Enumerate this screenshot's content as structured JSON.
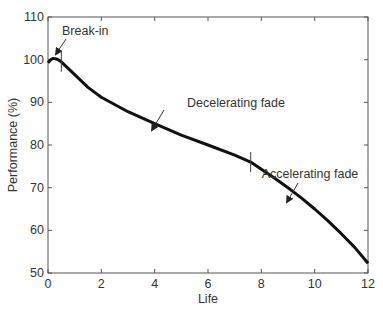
{
  "chart_data": {
    "type": "line",
    "title": "",
    "xlabel": "Life",
    "ylabel": "Performance (%)",
    "xlim": [
      0,
      12
    ],
    "ylim": [
      50,
      110
    ],
    "xticks": [
      0,
      2,
      4,
      6,
      8,
      10,
      12
    ],
    "yticks": [
      50,
      60,
      70,
      80,
      90,
      100,
      110
    ],
    "grid": false,
    "legend": null,
    "series": [
      {
        "name": "Performance",
        "x": [
          0,
          0.1,
          0.2,
          0.35,
          0.5,
          1,
          1.5,
          2,
          3,
          4,
          5,
          6,
          7,
          7.6,
          8,
          8.5,
          9,
          9.5,
          10,
          10.5,
          11,
          11.5,
          12
        ],
        "y": [
          99.3,
          100.0,
          100.3,
          100.1,
          99.5,
          96.5,
          93.5,
          91.2,
          87.8,
          85.0,
          82.3,
          80.0,
          77.6,
          76.0,
          74.3,
          72.2,
          70.0,
          67.6,
          65.0,
          62.2,
          59.2,
          56.0,
          52.3
        ]
      }
    ],
    "phase_markers": [
      0.5,
      7.6
    ],
    "annotations": [
      {
        "text": "Break-in",
        "x": 0.2,
        "y": 100.3
      },
      {
        "text": "Decelerating fade",
        "x": 3.8,
        "y": 85.5
      },
      {
        "text": "Accelerating fade",
        "x": 8.9,
        "y": 71.0
      }
    ]
  }
}
